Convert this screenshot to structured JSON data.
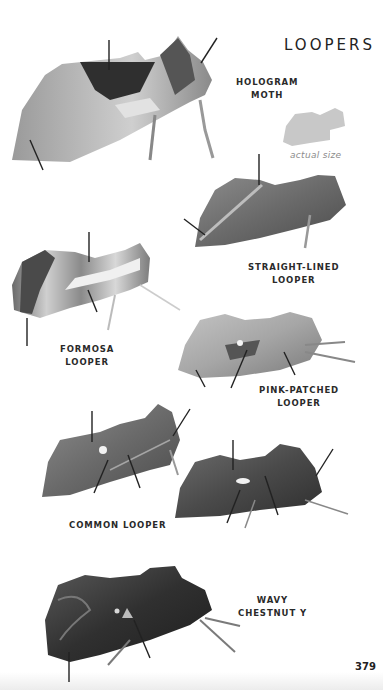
{
  "page": {
    "section_title": "LOOPERS",
    "page_number": "379",
    "actual_size_caption": "actual size"
  },
  "species": [
    {
      "id": "hologram-moth",
      "lines": [
        "HOLOGRAM",
        "MOTH"
      ]
    },
    {
      "id": "straight-lined-looper",
      "lines": [
        "STRAIGHT-LINED",
        "LOOPER"
      ]
    },
    {
      "id": "formosa-looper",
      "lines": [
        "FORMOSA",
        "LOOPER"
      ]
    },
    {
      "id": "pink-patched-looper",
      "lines": [
        "PINK-PATCHED",
        "LOOPER"
      ]
    },
    {
      "id": "common-looper",
      "lines": [
        "COMMON LOOPER"
      ]
    },
    {
      "id": "wavy-chestnut-y",
      "lines": [
        "WAVY",
        "CHESTNUT Y"
      ]
    }
  ],
  "colors": {
    "text": "#222222",
    "caption_gray": "#8c8c8c",
    "silhouette_gray": "#c8c8c8"
  }
}
